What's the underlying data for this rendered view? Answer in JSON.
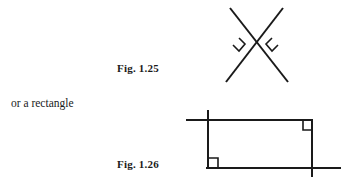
{
  "page": {
    "width": 348,
    "height": 184,
    "background_color": "#ffffff",
    "ink_color": "#1a1a1a"
  },
  "body_text": {
    "or_a_rectangle": "or a rectangle"
  },
  "captions": {
    "fig_125": "Fig. 1.25",
    "fig_126": "Fig. 1.26"
  },
  "figures": [
    {
      "id": "fig-1.25",
      "caption": "Fig. 1.25",
      "description": "Rhombus (diamond) formed by two pairs of crossing straight lines, with right-angle marks at the left and right vertices",
      "stroke_color": "#1a1a1a",
      "stroke_width": 2,
      "lines": [
        {
          "name": "line-down-right",
          "x1": 230,
          "y1": 8,
          "x2": 288,
          "y2": 82
        },
        {
          "name": "line-down-left",
          "x1": 283,
          "y1": 8,
          "x2": 226,
          "y2": 82
        }
      ],
      "crossings": [
        {
          "name": "top-crossing",
          "x": 256,
          "y": 18
        },
        {
          "name": "bottom-crossing",
          "x": 256,
          "y": 72
        }
      ],
      "vertices": [
        {
          "name": "left-vertex",
          "x": 234,
          "y": 45,
          "right_angle_mark": true
        },
        {
          "name": "right-vertex",
          "x": 278,
          "y": 45,
          "right_angle_mark": true
        }
      ]
    },
    {
      "id": "fig-1.26",
      "caption": "Fig. 1.26",
      "description": "Rectangle formed by four straight lines that overshoot at two opposite corners, with right-angle marks at the top-right and bottom-left corners",
      "stroke_color": "#1a1a1a",
      "stroke_width": 2,
      "lines": [
        {
          "name": "top-line",
          "x1": 186,
          "y1": 120,
          "x2": 313,
          "y2": 120
        },
        {
          "name": "bottom-line",
          "x1": 206,
          "y1": 168,
          "x2": 341,
          "y2": 168
        },
        {
          "name": "left-line",
          "x1": 208,
          "y1": 110,
          "x2": 208,
          "y2": 168
        },
        {
          "name": "right-line",
          "x1": 312,
          "y1": 120,
          "x2": 312,
          "y2": 177
        }
      ],
      "corners": [
        {
          "name": "top-left-corner",
          "x": 208,
          "y": 120,
          "right_angle_mark": false,
          "overshoot": true
        },
        {
          "name": "top-right-corner",
          "x": 312,
          "y": 120,
          "right_angle_mark": true,
          "overshoot": false
        },
        {
          "name": "bottom-left-corner",
          "x": 208,
          "y": 168,
          "right_angle_mark": true,
          "overshoot": false
        },
        {
          "name": "bottom-right-corner",
          "x": 312,
          "y": 168,
          "right_angle_mark": false,
          "overshoot": true
        }
      ]
    }
  ]
}
